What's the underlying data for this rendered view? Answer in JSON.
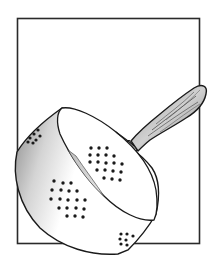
{
  "illustration": {
    "subject": "colander",
    "description": "Pen-and-ink sketch of a perforated colander with a wooden handle, tilted, overlapping a square frame",
    "colors": {
      "background": "#ffffff",
      "ink": "#1a1a1a",
      "frame": "#2a2a2a",
      "shading": "#9a9a9a",
      "handle_wood": "#6a6a6a"
    },
    "frame": {
      "x": 17,
      "y": 18,
      "width": 183,
      "height": 225
    },
    "hole_groups": [
      {
        "name": "upper-left-rim",
        "count": 7
      },
      {
        "name": "center-upper",
        "count": 24
      },
      {
        "name": "center-lower",
        "count": 24
      },
      {
        "name": "bottom-rim",
        "count": 7
      }
    ]
  }
}
